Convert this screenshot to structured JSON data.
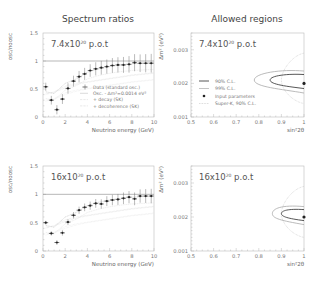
{
  "titles": {
    "left": "Spectrum ratios",
    "right": "Allowed regions"
  },
  "pot_labels": {
    "top": {
      "mant": "7.4x10",
      "exp": "20",
      "suffix": " p.o.t"
    },
    "bottom": {
      "mant": "16x10",
      "exp": "20",
      "suffix": " p.o.t"
    }
  },
  "left_axes": {
    "ylabel": "osc/noosc",
    "xlabel": "Neutrino energy (GeV)",
    "yticks": [
      "0",
      "0.5",
      "1",
      "1.5"
    ],
    "xticks": [
      "0",
      "2",
      "4",
      "6",
      "8",
      "10"
    ]
  },
  "right_axes": {
    "ylabel": "Δm² (eV²)",
    "xlabel": "sin²2θ",
    "yticks": [
      "0.001",
      "0.002",
      "0.003"
    ],
    "xticks": [
      "0.5",
      "0.6",
      "0.7",
      "0.8",
      "0.9",
      "1"
    ]
  },
  "legend_left": [
    "Data (standard osc.)",
    "Osc. - Δm²=0.0014 eV²",
    "+ decay (SK)",
    "+ decoherence (SK)"
  ],
  "legend_right": [
    "90% C.L.",
    "99% C.L.",
    "Input parameters",
    "Super-K, 90% C.L."
  ],
  "chart_data": [
    {
      "type": "scatter",
      "title": "Spectrum ratios",
      "annotation": "7.4x10^20 p.o.t",
      "xlabel": "Neutrino energy (GeV)",
      "ylabel": "osc/noosc",
      "xlim": [
        0,
        10
      ],
      "ylim": [
        0,
        1.5
      ],
      "reference_line": 1,
      "series": [
        {
          "name": "Data (standard osc.)",
          "x": [
            0.25,
            0.75,
            1.25,
            1.75,
            2.25,
            2.75,
            3.25,
            3.75,
            4.25,
            4.75,
            5.25,
            5.75,
            6.25,
            6.75,
            7.25,
            7.75,
            8.25,
            8.75,
            9.25,
            9.75
          ],
          "y": [
            0.54,
            0.3,
            0.13,
            0.32,
            0.51,
            0.64,
            0.72,
            0.77,
            0.83,
            0.86,
            0.88,
            0.9,
            0.92,
            0.93,
            0.93,
            0.94,
            0.97,
            0.96,
            0.96,
            0.96
          ]
        },
        {
          "name": "Osc. - Δm²=0.0014 eV²",
          "x": [
            0.25,
            1,
            2,
            3,
            4,
            5,
            6,
            7,
            8,
            9,
            10
          ],
          "y": [
            0.45,
            0.42,
            0.6,
            0.68,
            0.8,
            0.86,
            0.9,
            0.93,
            0.95,
            0.96,
            0.97
          ]
        },
        {
          "name": "+ decay (SK)",
          "x": [
            0.25,
            1,
            2,
            3,
            4,
            5,
            6,
            7,
            8,
            9,
            10
          ],
          "y": [
            0.4,
            0.45,
            0.55,
            0.6,
            0.63,
            0.66,
            0.69,
            0.72,
            0.75,
            0.77,
            0.79
          ]
        },
        {
          "name": "+ decoherence (SK)",
          "x": [
            0.25,
            1,
            2,
            3,
            4,
            5,
            6,
            7,
            8,
            9,
            10
          ],
          "y": [
            0.42,
            0.44,
            0.52,
            0.58,
            0.62,
            0.65,
            0.68,
            0.71,
            0.74,
            0.76,
            0.78
          ]
        }
      ]
    },
    {
      "type": "line",
      "title": "Allowed regions",
      "annotation": "7.4x10^20 p.o.t",
      "xlabel": "sin²2θ",
      "ylabel": "Δm² (eV²)",
      "xlim": [
        0.5,
        1
      ],
      "ylim": [
        0.001,
        0.0035
      ],
      "input_point": {
        "x": 1.0,
        "y": 0.002
      },
      "contours": [
        "90% C.L.",
        "99% C.L.",
        "Super-K, 90% C.L."
      ]
    },
    {
      "type": "scatter",
      "title": "Spectrum ratios",
      "annotation": "16x10^20 p.o.t",
      "xlabel": "Neutrino energy (GeV)",
      "ylabel": "osc/noosc",
      "xlim": [
        0,
        10
      ],
      "ylim": [
        0,
        1.5
      ],
      "reference_line": 1,
      "series": [
        {
          "name": "Data (standard osc.)",
          "x": [
            0.25,
            0.75,
            1.25,
            1.75,
            2.25,
            2.75,
            3.25,
            3.75,
            4.25,
            4.75,
            5.25,
            5.75,
            6.25,
            6.75,
            7.25,
            7.75,
            8.25,
            8.75,
            9.25,
            9.75
          ],
          "y": [
            0.5,
            0.31,
            0.15,
            0.32,
            0.51,
            0.63,
            0.72,
            0.77,
            0.8,
            0.84,
            0.83,
            0.88,
            0.9,
            0.91,
            0.93,
            0.95,
            0.92,
            0.97,
            0.97,
            0.97
          ]
        }
      ]
    },
    {
      "type": "line",
      "title": "Allowed regions",
      "annotation": "16x10^20 p.o.t",
      "xlabel": "sin²2θ",
      "ylabel": "Δm² (eV²)",
      "xlim": [
        0.5,
        1
      ],
      "ylim": [
        0.001,
        0.0035
      ],
      "input_point": {
        "x": 1.0,
        "y": 0.002
      },
      "contours": [
        "90% C.L.",
        "99% C.L.",
        "Super-K, 90% C.L."
      ]
    }
  ]
}
